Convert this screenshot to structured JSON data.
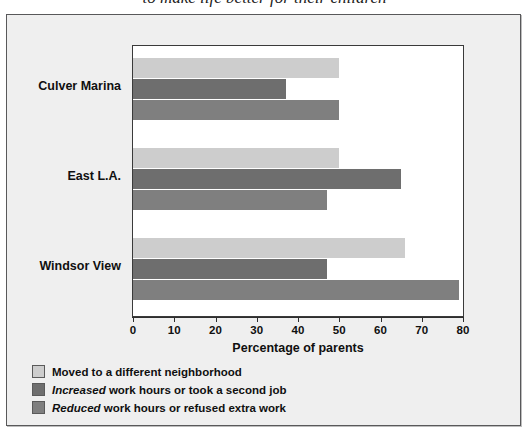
{
  "caption": {
    "text": "to make life better for their children"
  },
  "chart_data": {
    "type": "bar",
    "orientation": "horizontal",
    "title": "",
    "xlabel": "Percentage of parents",
    "ylabel": "",
    "xlim": [
      0,
      80
    ],
    "xticks": [
      0,
      10,
      20,
      30,
      40,
      50,
      60,
      70,
      80
    ],
    "xtick_labels": [
      "0",
      "10",
      "20",
      "30",
      "40",
      "50",
      "60",
      "70",
      "80"
    ],
    "grid": false,
    "legend_position": "below-left",
    "categories": [
      "Culver Marina",
      "East L.A.",
      "Windsor View"
    ],
    "series": [
      {
        "name": "Moved to a different neighborhood",
        "color": "#cdcdcd",
        "values": [
          50,
          50,
          66
        ]
      },
      {
        "name": "Increased work hours or took a second job",
        "color": "#6e6e6e",
        "values": [
          37,
          65,
          47
        ],
        "emphasis": "Increased"
      },
      {
        "name": "Reduced work hours or refused extra work",
        "color": "#7f7f7f",
        "values": [
          50,
          47,
          79
        ],
        "emphasis": "Reduced"
      }
    ]
  },
  "legend": {
    "items": [
      {
        "swatch": "#cdcdcd",
        "italic": "",
        "rest": "Moved to a different neighborhood"
      },
      {
        "swatch": "#6e6e6e",
        "italic": "Increased",
        "rest": " work hours or took a second job"
      },
      {
        "swatch": "#7f7f7f",
        "italic": "Reduced",
        "rest": " work hours or refused extra work"
      }
    ]
  },
  "colors": {
    "frame": "#58585a",
    "panel": "#efefef",
    "plot_bg": "#ffffff",
    "axis": "#2e2e2e",
    "text": "#101010"
  }
}
